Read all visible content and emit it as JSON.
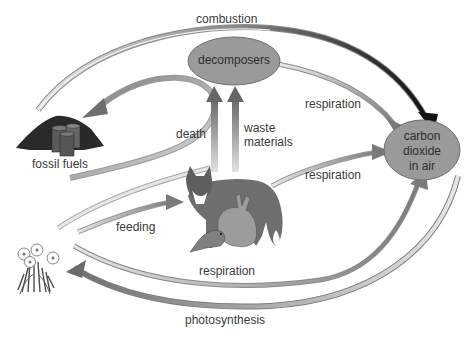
{
  "diagram": {
    "nodes": {
      "decomposers": {
        "label": "decomposers"
      },
      "co2": {
        "line1": "carbon",
        "line2": "dioxide",
        "line3": "in air"
      },
      "fossil_fuels": {
        "label": "fossil fuels"
      },
      "animals": {
        "label": "fox, rabbit and bird"
      },
      "plants": {
        "label": "plants"
      }
    },
    "processes": {
      "combustion": "combustion",
      "respiration_decomposers": "respiration",
      "death": "death",
      "waste_line1": "waste",
      "waste_line2": "materials",
      "respiration_animals": "respiration",
      "feeding": "feeding",
      "respiration_plants": "respiration",
      "photosynthesis": "photosynthesis"
    },
    "colors": {
      "ellipse_fill": "#9a9a9a",
      "ellipse_stroke": "#6e6e6e",
      "arrow_dark": "#1e1e1e",
      "arrow_mid": "#7d7d7d",
      "arrow_light": "#d8d8d8",
      "text": "#3a3a3a"
    }
  }
}
